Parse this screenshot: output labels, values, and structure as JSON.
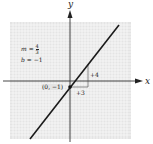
{
  "figure": {
    "type": "linear-equation-graph",
    "axes": {
      "x_label": "x",
      "y_label": "y"
    },
    "equation_params": {
      "slope_label": "m",
      "slope_equals": "=",
      "slope_numerator": "4",
      "slope_denominator": "3",
      "intercept_label": "b",
      "intercept_value": "= −1"
    },
    "point": {
      "label": "(0, −1)",
      "x": 0,
      "y": -1
    },
    "slope_triangle": {
      "rise_label": "+4",
      "run_label": "+3"
    },
    "colors": {
      "grid_background": "#e6e6e6",
      "grid_lines": "#ffffff",
      "axis": "#333333",
      "line": "#1a1a1a"
    }
  }
}
